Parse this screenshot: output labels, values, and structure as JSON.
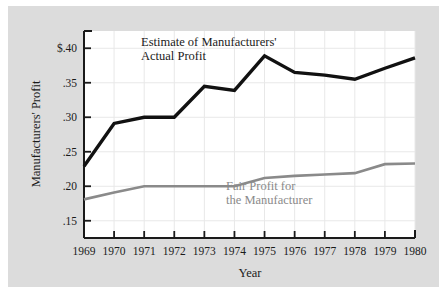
{
  "figure": {
    "background_color": "#dcdcdc",
    "plot_background_color": "#ffffff",
    "frame_color": "#1a1a1a"
  },
  "chart_data": {
    "type": "line",
    "title": "",
    "xlabel": "Year",
    "ylabel": "Manufacturers' Profit",
    "x": [
      1969,
      1970,
      1971,
      1972,
      1973,
      1974,
      1975,
      1976,
      1977,
      1978,
      1979,
      1980
    ],
    "categories": [
      "1969",
      "1970",
      "1971",
      "1972",
      "1973",
      "1974",
      "1975",
      "1976",
      "1977",
      "1978",
      "1979",
      "1980"
    ],
    "xlim": [
      1969,
      1980
    ],
    "ylim": [
      0.125,
      0.425
    ],
    "ytick_values": [
      0.4,
      0.35,
      0.3,
      0.25,
      0.2,
      0.15
    ],
    "ytick_labels": [
      "$.40",
      ".35",
      ".30",
      ".25",
      ".20",
      ".15"
    ],
    "grid": true,
    "grid_color": "#e8e8e8",
    "legend": "annotations-inline",
    "series": [
      {
        "name": "Estimate of Manufacturers' Actual Profit",
        "color": "#111111",
        "line_width": 3.4,
        "values": [
          0.229,
          0.291,
          0.3,
          0.3,
          0.345,
          0.339,
          0.389,
          0.365,
          0.361,
          0.355,
          0.371,
          0.386
        ]
      },
      {
        "name": "Fair Profit for the Manufacturer",
        "color": "#8a8a8a",
        "line_width": 2.6,
        "values": [
          0.181,
          0.191,
          0.2,
          0.2,
          0.2,
          0.2,
          0.212,
          0.215,
          0.217,
          0.219,
          0.232,
          0.233
        ]
      }
    ],
    "annotations": [
      {
        "id": "black-series-label",
        "lines": [
          "Estimate of Manufacturers'",
          "Actual Profit"
        ],
        "color": "#1a1a1a"
      },
      {
        "id": "gray-series-label",
        "lines": [
          "Fair Profit for",
          "the Manufacturer"
        ],
        "color": "#8a8a8a"
      }
    ]
  },
  "axes": {
    "y_title": "Manufacturers' Profit",
    "x_title": "Year"
  }
}
